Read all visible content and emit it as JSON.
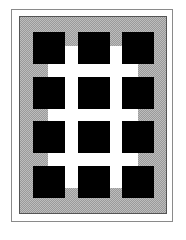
{
  "figure": {
    "colors": {
      "background": "#ffffff",
      "frame_border": "#8a8a8a",
      "hatch_dark": "#9a9a9a",
      "hatch_light": "#bdbdbd",
      "lattice": "#ffffff",
      "cell": "#000000"
    },
    "grid": {
      "columns": 3,
      "rows": 4,
      "column_x": [
        33,
        78,
        122
      ],
      "row_y": [
        32,
        77,
        121,
        166
      ],
      "cell_size": 32
    }
  }
}
